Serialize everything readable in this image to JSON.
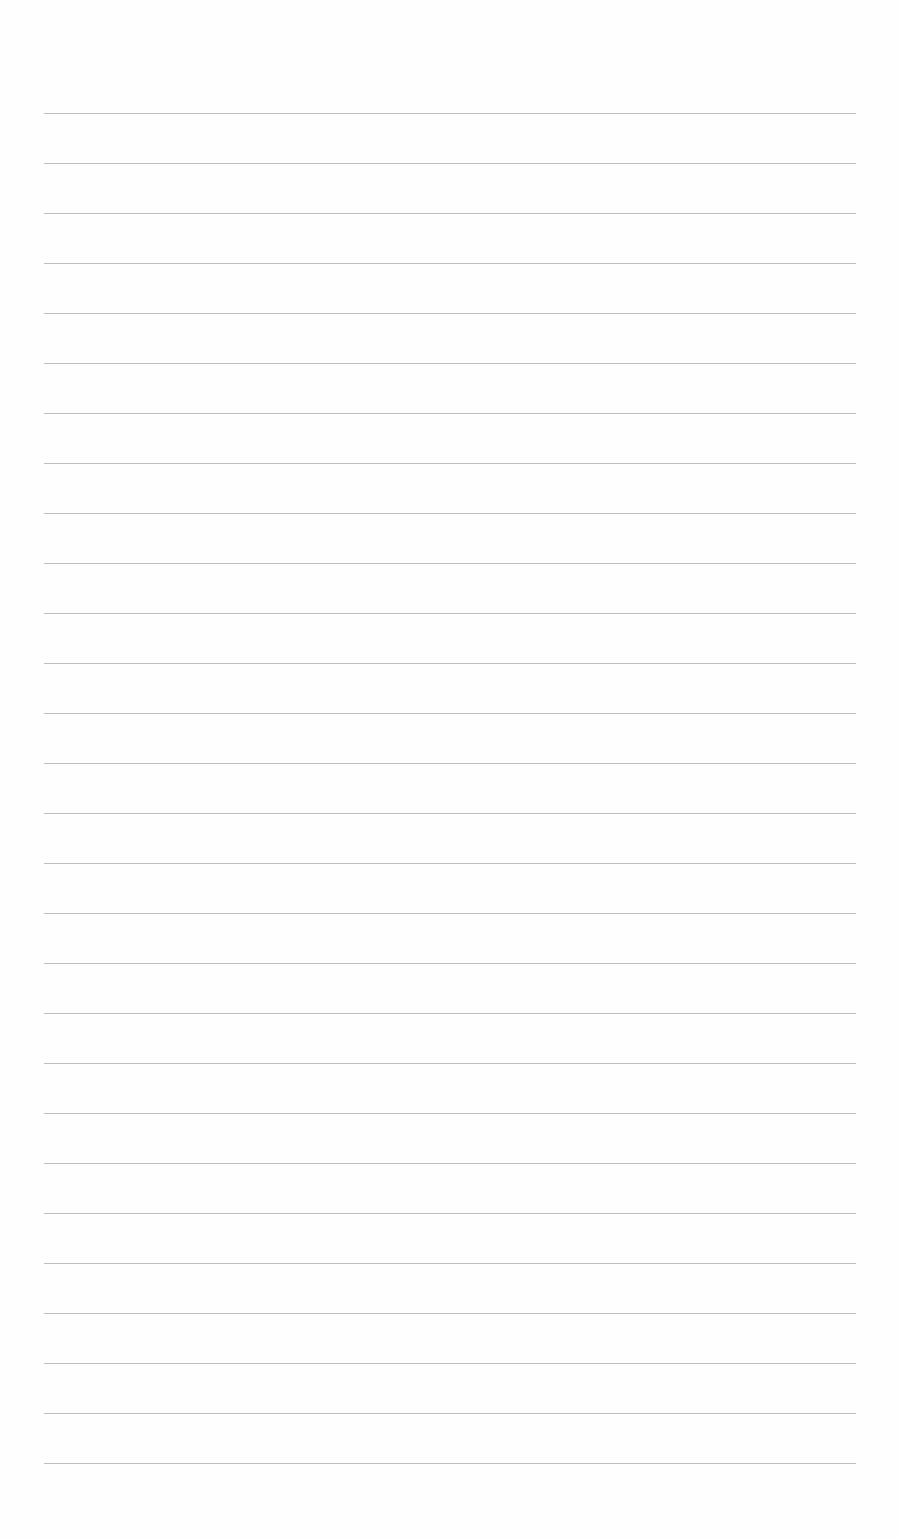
{
  "page": {
    "type": "lined-paper",
    "background_color": "#fefefe",
    "line_color": "#b4b4b4",
    "line_count": 28,
    "first_line_y": 113,
    "line_spacing": 50,
    "line_left": 44,
    "line_right": 856
  }
}
